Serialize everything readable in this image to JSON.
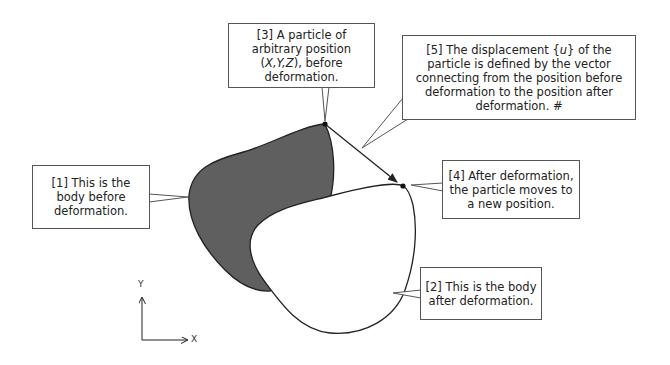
{
  "diagram": {
    "type": "deformation-displacement",
    "colors": {
      "body_before_fill": "#5f5f5f",
      "body_after_fill": "#ffffff",
      "outline": "#222222",
      "callout_border": "#555555"
    },
    "callouts": [
      {
        "id": "1",
        "text": "[1] This is the body before deformation."
      },
      {
        "id": "2",
        "text": "[2] This is the body after deformation."
      },
      {
        "id": "3",
        "text_prefix": "[3] A particle of arbitrary position (",
        "text_vars": "X,Y,Z",
        "text_suffix": "), before deformation."
      },
      {
        "id": "4",
        "text": "[4] After deformation, the particle moves to a new position."
      },
      {
        "id": "5",
        "text_prefix": "[5] The displacement {",
        "text_var": "u",
        "text_suffix": "} of the particle is defined by the vector connecting from the position before deformation to the position after deformation. #"
      }
    ],
    "axes": {
      "x_label": "X",
      "y_label": "Y"
    }
  }
}
